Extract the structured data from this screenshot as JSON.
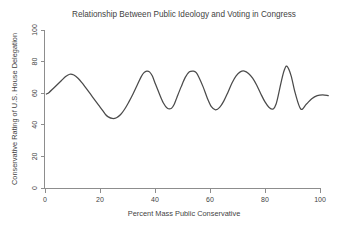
{
  "chart_data": {
    "type": "line",
    "title": "Relationship Between Public Ideology and Voting in Congress",
    "xlabel": "Percent Mass Public Conservative",
    "ylabel": "Conservative Rating of U.S. House Delegation",
    "xlim": [
      0,
      104
    ],
    "ylim": [
      0,
      104
    ],
    "xticks": [
      0,
      20,
      40,
      60,
      80,
      100
    ],
    "yticks": [
      0,
      20,
      40,
      60,
      80,
      100
    ],
    "xtick_labels": [
      "0",
      "20",
      "40",
      "60",
      "80",
      "100"
    ],
    "ytick_labels": [
      "0",
      "20",
      "40",
      "60",
      "80",
      "100"
    ],
    "grid": false,
    "legend": "none",
    "series": [
      {
        "name": "Smoothed fit",
        "color": "#4a4a4a",
        "x": [
          0.5,
          1.5,
          3.0,
          4.5,
          6.0,
          7.5,
          9.0,
          10.5,
          12.0,
          13.5,
          15.0,
          16.5,
          18.0,
          19.5,
          21.0,
          22.0,
          23.0,
          24.5,
          26.0,
          27.5,
          29.0,
          30.5,
          32.0,
          33.5,
          35.0,
          36.0,
          37.0,
          38.0,
          39.0,
          40.0,
          41.5,
          43.0,
          44.5,
          46.0,
          47.0,
          48.0,
          49.5,
          51.0,
          52.5,
          54.0,
          55.0,
          56.0,
          57.5,
          59.0,
          60.5,
          62.0,
          63.5,
          65.0,
          66.5,
          68.0,
          69.5,
          71.0,
          72.5,
          74.0,
          75.5,
          77.0,
          78.5,
          80.0,
          81.5,
          83.0,
          84.0,
          85.0,
          86.0,
          87.0,
          88.0,
          89.5,
          91.0,
          93.0,
          95.0,
          97.0,
          99.0,
          101.0,
          103.0
        ],
        "y": [
          59.5,
          60.5,
          63.0,
          65.5,
          68.0,
          70.5,
          72.0,
          71.5,
          69.5,
          66.5,
          63.0,
          59.5,
          56.0,
          52.5,
          49.0,
          46.5,
          45.0,
          44.0,
          44.5,
          46.5,
          50.0,
          54.5,
          59.5,
          65.0,
          70.5,
          73.0,
          74.0,
          73.5,
          71.0,
          66.5,
          60.0,
          54.0,
          50.5,
          50.5,
          53.0,
          57.5,
          64.0,
          70.0,
          73.5,
          74.0,
          73.0,
          70.0,
          64.0,
          57.0,
          51.5,
          49.5,
          51.0,
          55.0,
          60.5,
          66.5,
          71.0,
          73.5,
          74.0,
          72.5,
          69.5,
          65.0,
          59.5,
          54.5,
          51.0,
          50.0,
          53.0,
          60.0,
          68.0,
          74.5,
          77.0,
          71.0,
          60.0,
          50.0,
          53.0,
          56.5,
          58.5,
          59.0,
          58.5
        ]
      }
    ]
  },
  "axes": {
    "x_axis_name": "x-axis",
    "y_axis_name": "y-axis"
  }
}
